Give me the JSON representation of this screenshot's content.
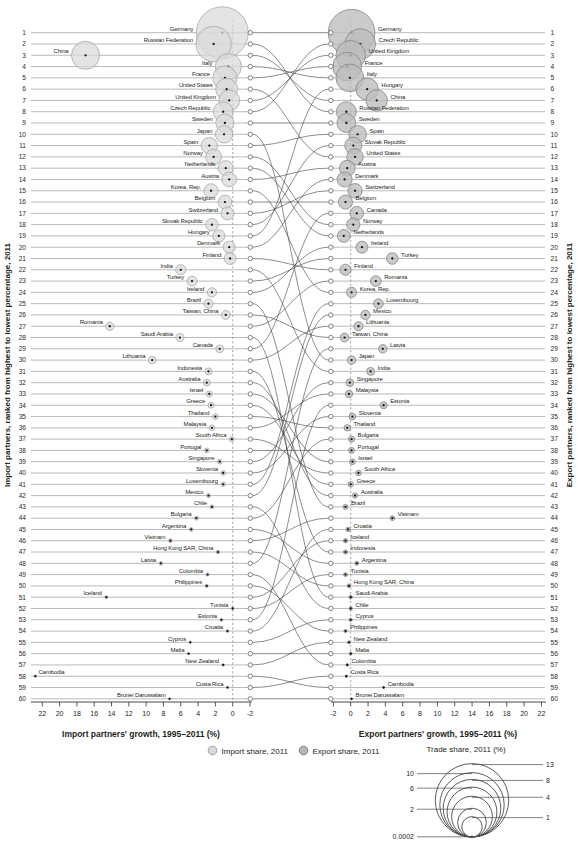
{
  "figure": {
    "left_x_axis_title": "Import partners' growth, 1995–2011 (%)",
    "right_x_axis_title": "Export partners' growth, 1995–2011 (%)",
    "left_y_axis_title": "Import partners, ranked from highest to lowest percentage, 2011",
    "right_y_axis_title": "Export partners, ranked from highest to lowest percentage, 2011",
    "legend_import_label": "Import share, 2011",
    "legend_export_label": "Export share, 2011",
    "size_legend_title": "Trade share, 2011 (%)"
  },
  "colors": {
    "import_fill": "#d9d9d9",
    "import_stroke": "#9f9f9f",
    "export_fill": "#bdbdbd",
    "export_stroke": "#858585",
    "row_line": "#9c9c9c",
    "curve": "#3c3c3c",
    "dashed_zero_line": "#8f8f8f",
    "text": "#231f20"
  },
  "chart_data": {
    "type": "scatter",
    "subtype": "bubble-bump-chart",
    "x_ticks_left": [
      22,
      20,
      18,
      16,
      14,
      12,
      10,
      8,
      6,
      4,
      2,
      0,
      -2
    ],
    "x_ticks_right": [
      -2,
      0,
      2,
      4,
      6,
      8,
      10,
      12,
      14,
      16,
      18,
      20,
      22
    ],
    "import_partners": [
      {
        "rank": 1,
        "name": "Germany",
        "growth_pct": 1.2,
        "share_pct": 13
      },
      {
        "rank": 2,
        "name": "Russian Federation",
        "growth_pct": 2.2,
        "share_pct": 6
      },
      {
        "rank": 3,
        "name": "China",
        "growth_pct": 17.0,
        "share_pct": 3.8
      },
      {
        "rank": 4,
        "name": "Italy",
        "growth_pct": 0.5,
        "share_pct": 3.3
      },
      {
        "rank": 5,
        "name": "France",
        "growth_pct": 0.9,
        "share_pct": 2.8
      },
      {
        "rank": 6,
        "name": "United States",
        "growth_pct": 0.7,
        "share_pct": 2.3
      },
      {
        "rank": 7,
        "name": "United Kingdom",
        "growth_pct": 0.4,
        "share_pct": 2.1
      },
      {
        "rank": 8,
        "name": "Czech Republic",
        "growth_pct": 1.1,
        "share_pct": 1.9
      },
      {
        "rank": 9,
        "name": "Sweden",
        "growth_pct": 0.9,
        "share_pct": 1.6
      },
      {
        "rank": 10,
        "name": "Japan",
        "growth_pct": 1.0,
        "share_pct": 1.45
      },
      {
        "rank": 11,
        "name": "Spain",
        "growth_pct": 2.7,
        "share_pct": 1.3
      },
      {
        "rank": 12,
        "name": "Norway",
        "growth_pct": 2.2,
        "share_pct": 1.2
      },
      {
        "rank": 13,
        "name": "Netherlands",
        "growth_pct": 0.8,
        "share_pct": 1.1
      },
      {
        "rank": 14,
        "name": "Austria",
        "growth_pct": 0.4,
        "share_pct": 1.05
      },
      {
        "rank": 15,
        "name": "Korea, Rep.",
        "growth_pct": 2.5,
        "share_pct": 0.95
      },
      {
        "rank": 16,
        "name": "Belgium",
        "growth_pct": 0.9,
        "share_pct": 0.9
      },
      {
        "rank": 17,
        "name": "Switzerland",
        "growth_pct": 0.6,
        "share_pct": 0.82
      },
      {
        "rank": 18,
        "name": "Slovak Republic",
        "growth_pct": 2.4,
        "share_pct": 0.75
      },
      {
        "rank": 19,
        "name": "Hungary",
        "growth_pct": 1.6,
        "share_pct": 0.72
      },
      {
        "rank": 20,
        "name": "Denmark",
        "growth_pct": 0.4,
        "share_pct": 0.7
      },
      {
        "rank": 21,
        "name": "Finland",
        "growth_pct": 0.3,
        "share_pct": 0.68
      },
      {
        "rank": 22,
        "name": "India",
        "growth_pct": 6.0,
        "share_pct": 0.5
      },
      {
        "rank": 23,
        "name": "Turkey",
        "growth_pct": 4.7,
        "share_pct": 0.48
      },
      {
        "rank": 24,
        "name": "Ireland",
        "growth_pct": 2.4,
        "share_pct": 0.42
      },
      {
        "rank": 25,
        "name": "Brazil",
        "growth_pct": 2.8,
        "share_pct": 0.4
      },
      {
        "rank": 26,
        "name": "Taiwan, China",
        "growth_pct": 0.8,
        "share_pct": 0.38
      },
      {
        "rank": 27,
        "name": "Romania",
        "growth_pct": 14.2,
        "share_pct": 0.33
      },
      {
        "rank": 28,
        "name": "Saudi Arabia",
        "growth_pct": 6.1,
        "share_pct": 0.31
      },
      {
        "rank": 29,
        "name": "Canada",
        "growth_pct": 1.5,
        "share_pct": 0.3
      },
      {
        "rank": 30,
        "name": "Lithuania",
        "growth_pct": 9.3,
        "share_pct": 0.28
      },
      {
        "rank": 31,
        "name": "Indonesia",
        "growth_pct": 2.8,
        "share_pct": 0.24
      },
      {
        "rank": 32,
        "name": "Australia",
        "growth_pct": 3.0,
        "share_pct": 0.22
      },
      {
        "rank": 33,
        "name": "Israel",
        "growth_pct": 2.7,
        "share_pct": 0.18
      },
      {
        "rank": 34,
        "name": "Greece",
        "growth_pct": 2.5,
        "share_pct": 0.17
      },
      {
        "rank": 35,
        "name": "Thailand",
        "growth_pct": 2.0,
        "share_pct": 0.16
      },
      {
        "rank": 36,
        "name": "Malaysia",
        "growth_pct": 2.4,
        "share_pct": 0.155
      },
      {
        "rank": 37,
        "name": "South Africa",
        "growth_pct": 0.1,
        "share_pct": 0.12
      },
      {
        "rank": 38,
        "name": "Portugal",
        "growth_pct": 3.0,
        "share_pct": 0.115
      },
      {
        "rank": 39,
        "name": "Singapore",
        "growth_pct": 1.5,
        "share_pct": 0.11
      },
      {
        "rank": 40,
        "name": "Slovenia",
        "growth_pct": 1.1,
        "share_pct": 0.105
      },
      {
        "rank": 41,
        "name": "Luxembourg",
        "growth_pct": 1.1,
        "share_pct": 0.1
      },
      {
        "rank": 42,
        "name": "Mexico",
        "growth_pct": 2.8,
        "share_pct": 0.085
      },
      {
        "rank": 43,
        "name": "Chile",
        "growth_pct": 2.4,
        "share_pct": 0.08
      },
      {
        "rank": 44,
        "name": "Bulgaria",
        "growth_pct": 4.2,
        "share_pct": 0.078
      },
      {
        "rank": 45,
        "name": "Argentina",
        "growth_pct": 4.8,
        "share_pct": 0.075
      },
      {
        "rank": 46,
        "name": "Vietnam",
        "growth_pct": 7.2,
        "share_pct": 0.072
      },
      {
        "rank": 47,
        "name": "Hong Kong SAR, China",
        "growth_pct": 1.7,
        "share_pct": 0.07
      },
      {
        "rank": 48,
        "name": "Latvia",
        "growth_pct": 8.3,
        "share_pct": 0.068
      },
      {
        "rank": 49,
        "name": "Colombia",
        "growth_pct": 2.9,
        "share_pct": 0.05
      },
      {
        "rank": 50,
        "name": "Philippines",
        "growth_pct": 3.0,
        "share_pct": 0.048
      },
      {
        "rank": 51,
        "name": "Iceland",
        "growth_pct": 14.6,
        "share_pct": 0.046
      },
      {
        "rank": 52,
        "name": "Tunisia",
        "growth_pct": 0.0,
        "share_pct": 0.044
      },
      {
        "rank": 53,
        "name": "Estonia",
        "growth_pct": 1.3,
        "share_pct": 0.042
      },
      {
        "rank": 54,
        "name": "Croatia",
        "growth_pct": 0.6,
        "share_pct": 0.04
      },
      {
        "rank": 55,
        "name": "Cyprus",
        "growth_pct": 4.9,
        "share_pct": 0.03
      },
      {
        "rank": 56,
        "name": "Malta",
        "growth_pct": 5.1,
        "share_pct": 0.028
      },
      {
        "rank": 57,
        "name": "New Zealand",
        "growth_pct": 1.1,
        "share_pct": 0.026
      },
      {
        "rank": 58,
        "name": "Cambodia",
        "growth_pct": 22.8,
        "share_pct": 0.02,
        "label_side": "right"
      },
      {
        "rank": 59,
        "name": "Costa Rica",
        "growth_pct": 0.6,
        "share_pct": 0.018
      },
      {
        "rank": 60,
        "name": "Brunei Darussalam",
        "growth_pct": 7.3,
        "share_pct": 0.015
      }
    ],
    "export_partners": [
      {
        "rank": 1,
        "name": "Germany",
        "growth_pct": 0.1,
        "share_pct": 10.5
      },
      {
        "rank": 2,
        "name": "Czech Republic",
        "growth_pct": 1.1,
        "share_pct": 4.5
      },
      {
        "rank": 3,
        "name": "United Kingdom",
        "growth_pct": 0.0,
        "share_pct": 4.2
      },
      {
        "rank": 4,
        "name": "France",
        "growth_pct": -0.4,
        "share_pct": 4.0
      },
      {
        "rank": 5,
        "name": "Italy",
        "growth_pct": -0.1,
        "share_pct": 3.7
      },
      {
        "rank": 6,
        "name": "Hungary",
        "growth_pct": 1.9,
        "share_pct": 2.4
      },
      {
        "rank": 7,
        "name": "China",
        "growth_pct": 3.0,
        "share_pct": 2.2
      },
      {
        "rank": 8,
        "name": "Russian Federation",
        "growth_pct": -0.5,
        "share_pct": 1.9
      },
      {
        "rank": 9,
        "name": "Sweden",
        "growth_pct": -0.5,
        "share_pct": 1.7
      },
      {
        "rank": 10,
        "name": "Spain",
        "growth_pct": 0.8,
        "share_pct": 1.5
      },
      {
        "rank": 11,
        "name": "Slovak Republic",
        "growth_pct": 0.3,
        "share_pct": 1.4
      },
      {
        "rank": 12,
        "name": "United States",
        "growth_pct": 0.5,
        "share_pct": 1.3
      },
      {
        "rank": 13,
        "name": "Austria",
        "growth_pct": -0.4,
        "share_pct": 1.2
      },
      {
        "rank": 14,
        "name": "Denmark",
        "growth_pct": -0.7,
        "share_pct": 1.1
      },
      {
        "rank": 15,
        "name": "Switzerland",
        "growth_pct": 0.5,
        "share_pct": 1.0
      },
      {
        "rank": 16,
        "name": "Belgium",
        "growth_pct": -0.6,
        "share_pct": 0.95
      },
      {
        "rank": 17,
        "name": "Canada",
        "growth_pct": 0.7,
        "share_pct": 0.9
      },
      {
        "rank": 18,
        "name": "Norway",
        "growth_pct": 0.3,
        "share_pct": 0.85
      },
      {
        "rank": 19,
        "name": "Netherlands",
        "growth_pct": -0.8,
        "share_pct": 0.8
      },
      {
        "rank": 20,
        "name": "Ireland",
        "growth_pct": 1.3,
        "share_pct": 0.7
      },
      {
        "rank": 21,
        "name": "Turkey",
        "growth_pct": 4.8,
        "share_pct": 0.65
      },
      {
        "rank": 22,
        "name": "Finland",
        "growth_pct": -0.6,
        "share_pct": 0.6
      },
      {
        "rank": 23,
        "name": "Romania",
        "growth_pct": 2.9,
        "share_pct": 0.55
      },
      {
        "rank": 24,
        "name": "Korea, Rep.",
        "growth_pct": 0.1,
        "share_pct": 0.5
      },
      {
        "rank": 25,
        "name": "Luxembourg",
        "growth_pct": 3.2,
        "share_pct": 0.45
      },
      {
        "rank": 26,
        "name": "Mexico",
        "growth_pct": 1.7,
        "share_pct": 0.42
      },
      {
        "rank": 27,
        "name": "Lithuania",
        "growth_pct": 0.9,
        "share_pct": 0.4
      },
      {
        "rank": 28,
        "name": "Taiwan, China",
        "growth_pct": -0.7,
        "share_pct": 0.38
      },
      {
        "rank": 29,
        "name": "Latvia",
        "growth_pct": 3.7,
        "share_pct": 0.35
      },
      {
        "rank": 30,
        "name": "Japan",
        "growth_pct": 0.1,
        "share_pct": 0.32
      },
      {
        "rank": 31,
        "name": "India",
        "growth_pct": 2.3,
        "share_pct": 0.3
      },
      {
        "rank": 32,
        "name": "Singapore",
        "growth_pct": -0.1,
        "share_pct": 0.28
      },
      {
        "rank": 33,
        "name": "Malaysia",
        "growth_pct": -0.2,
        "share_pct": 0.26
      },
      {
        "rank": 34,
        "name": "Estonia",
        "growth_pct": 3.8,
        "share_pct": 0.24
      },
      {
        "rank": 35,
        "name": "Slovenia",
        "growth_pct": 0.2,
        "share_pct": 0.22
      },
      {
        "rank": 36,
        "name": "Thailand",
        "growth_pct": -0.4,
        "share_pct": 0.2
      },
      {
        "rank": 37,
        "name": "Bulgaria",
        "growth_pct": 0.1,
        "share_pct": 0.18
      },
      {
        "rank": 38,
        "name": "Portugal",
        "growth_pct": 0.1,
        "share_pct": 0.17
      },
      {
        "rank": 39,
        "name": "Israel",
        "growth_pct": 0.2,
        "share_pct": 0.16
      },
      {
        "rank": 40,
        "name": "South Africa",
        "growth_pct": 0.9,
        "share_pct": 0.15
      },
      {
        "rank": 41,
        "name": "Greece",
        "growth_pct": 0.0,
        "share_pct": 0.14
      },
      {
        "rank": 42,
        "name": "Australia",
        "growth_pct": 0.5,
        "share_pct": 0.13
      },
      {
        "rank": 43,
        "name": "Brazil",
        "growth_pct": -0.6,
        "share_pct": 0.12
      },
      {
        "rank": 44,
        "name": "Vietnam",
        "growth_pct": 4.8,
        "share_pct": 0.11
      },
      {
        "rank": 45,
        "name": "Croatia",
        "growth_pct": -0.3,
        "share_pct": 0.1
      },
      {
        "rank": 46,
        "name": "Iceland",
        "growth_pct": -0.6,
        "share_pct": 0.09
      },
      {
        "rank": 47,
        "name": "Indonesia",
        "growth_pct": -0.6,
        "share_pct": 0.085
      },
      {
        "rank": 48,
        "name": "Argentina",
        "growth_pct": 0.7,
        "share_pct": 0.08
      },
      {
        "rank": 49,
        "name": "Tunisia",
        "growth_pct": -0.6,
        "share_pct": 0.075
      },
      {
        "rank": 50,
        "name": "Hong Kong SAR, China",
        "growth_pct": -0.2,
        "share_pct": 0.07
      },
      {
        "rank": 51,
        "name": "Saudi Arabia",
        "growth_pct": 0.0,
        "share_pct": 0.065
      },
      {
        "rank": 52,
        "name": "Chile",
        "growth_pct": 0.0,
        "share_pct": 0.06
      },
      {
        "rank": 53,
        "name": "Cyprus",
        "growth_pct": 0.0,
        "share_pct": 0.055
      },
      {
        "rank": 54,
        "name": "Philippines",
        "growth_pct": -0.6,
        "share_pct": 0.05
      },
      {
        "rank": 55,
        "name": "New Zealand",
        "growth_pct": -0.2,
        "share_pct": 0.045
      },
      {
        "rank": 56,
        "name": "Malta",
        "growth_pct": 0.0,
        "share_pct": 0.04
      },
      {
        "rank": 57,
        "name": "Colombia",
        "growth_pct": -0.4,
        "share_pct": 0.035
      },
      {
        "rank": 58,
        "name": "Costa Rica",
        "growth_pct": -0.5,
        "share_pct": 0.03
      },
      {
        "rank": 59,
        "name": "Cambodia",
        "growth_pct": 3.8,
        "share_pct": 0.02
      },
      {
        "rank": 60,
        "name": "Brunei Darussalam",
        "growth_pct": 0.1,
        "share_pct": 0.015
      }
    ],
    "size_legend_values": [
      13,
      10,
      8,
      6,
      4,
      2,
      1,
      0.0002
    ],
    "size_legend_sides": [
      "right",
      "left",
      "right",
      "left",
      "right",
      "left",
      "right",
      "left"
    ]
  }
}
